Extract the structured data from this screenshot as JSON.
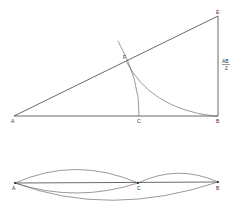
{
  "top_figure": {
    "points": {
      "A": {
        "label": "A",
        "x": 14,
        "y": 116
      },
      "B": {
        "label": "B",
        "x": 218,
        "y": 116
      },
      "C": {
        "label": "C",
        "x": 139,
        "y": 116
      },
      "E": {
        "label": "E",
        "x": 218,
        "y": 16
      },
      "F": {
        "label": "F",
        "x": 126,
        "y": 61
      }
    },
    "side_label_num": "AB",
    "side_label_den": "2"
  },
  "bottom_figure": {
    "points": {
      "A": {
        "label": "A",
        "x": 15,
        "y": 183
      },
      "C": {
        "label": "C",
        "x": 138,
        "y": 183
      },
      "B": {
        "label": "B",
        "x": 218,
        "y": 182
      }
    }
  }
}
